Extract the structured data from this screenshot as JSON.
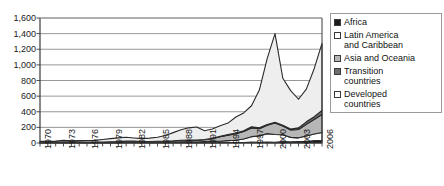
{
  "chart_data": {
    "type": "area",
    "stacked": true,
    "title": "",
    "xlabel": "",
    "ylabel": "",
    "ylim": [
      0,
      1600
    ],
    "ytick_step": 200,
    "grid": true,
    "legend_position": "right",
    "ytick_labels": [
      "1,600",
      "1,400",
      "1,200",
      "1,000",
      "800",
      "600",
      "400",
      "200",
      "0"
    ],
    "ytick_values": [
      1600,
      1400,
      1200,
      1000,
      800,
      600,
      400,
      200,
      0
    ],
    "xtick_labels": [
      "1970",
      "1973",
      "1976",
      "1979",
      "1982",
      "1985",
      "1988",
      "1991",
      "1994",
      "1997",
      "2000",
      "2003",
      "2006"
    ],
    "xtick_values": [
      1970,
      1973,
      1976,
      1979,
      1982,
      1985,
      1988,
      1991,
      1994,
      1997,
      2000,
      2003,
      2006
    ],
    "x": [
      1970,
      1971,
      1972,
      1973,
      1974,
      1975,
      1976,
      1977,
      1978,
      1979,
      1980,
      1981,
      1982,
      1983,
      1984,
      1985,
      1986,
      1987,
      1988,
      1989,
      1990,
      1991,
      1992,
      1993,
      1994,
      1995,
      1996,
      1997,
      1998,
      1999,
      2000,
      2001,
      2002,
      2003,
      2004,
      2005,
      2006
    ],
    "series": [
      {
        "name": "Africa",
        "color": "#1c1c1c",
        "values": [
          1,
          1,
          1,
          2,
          2,
          2,
          2,
          2,
          2,
          2,
          2,
          3,
          3,
          3,
          2,
          3,
          3,
          4,
          5,
          6,
          3,
          4,
          4,
          5,
          6,
          6,
          7,
          11,
          9,
          12,
          10,
          20,
          14,
          18,
          18,
          30,
          36
        ]
      },
      {
        "name": "Latin America\nand Caribbean",
        "color": "#ffffff",
        "values": [
          5,
          5,
          5,
          6,
          5,
          6,
          6,
          6,
          6,
          7,
          8,
          9,
          9,
          7,
          7,
          8,
          7,
          8,
          9,
          9,
          9,
          13,
          17,
          18,
          25,
          30,
          45,
          70,
          82,
          108,
          98,
          85,
          58,
          48,
          72,
          86,
          99
        ]
      },
      {
        "name": "Asia and Oceania",
        "color": "#b6b6b6",
        "values": [
          3,
          3,
          3,
          4,
          4,
          4,
          4,
          4,
          5,
          6,
          8,
          12,
          12,
          10,
          10,
          12,
          13,
          16,
          22,
          23,
          24,
          24,
          33,
          56,
          70,
          84,
          95,
          112,
          92,
          107,
          148,
          112,
          95,
          107,
          148,
          186,
          230
        ]
      },
      {
        "name": "Transition\ncountries",
        "color": "#6e6e6e",
        "values": [
          0,
          0,
          0,
          0,
          0,
          0,
          0,
          0,
          0,
          0,
          0,
          0,
          0,
          0,
          0,
          0,
          0,
          0,
          0,
          1,
          2,
          3,
          5,
          7,
          7,
          8,
          10,
          14,
          11,
          11,
          9,
          11,
          13,
          21,
          33,
          35,
          53
        ]
      },
      {
        "name": "Developed\ncountries",
        "color": "#eeeeee",
        "values": [
          13,
          14,
          15,
          22,
          16,
          18,
          20,
          22,
          32,
          41,
          48,
          49,
          40,
          36,
          43,
          50,
          73,
          105,
          134,
          155,
          167,
          113,
          121,
          135,
          147,
          205,
          228,
          270,
          484,
          843,
          1135,
          601,
          490,
          366,
          419,
          614,
          857
        ]
      }
    ],
    "legend": [
      {
        "label": "Africa",
        "swatch_color": "#1c1c1c"
      },
      {
        "label": "Latin America\nand Caribbean",
        "swatch_color": "#ffffff"
      },
      {
        "label": "Asia and Oceania",
        "swatch_color": "#b6b6b6"
      },
      {
        "label": "Transition\ncountries",
        "swatch_color": "#6e6e6e"
      },
      {
        "label": "Developed\ncountries",
        "swatch_color": "#ffffff"
      }
    ],
    "colors": {
      "axis": "#3a3a3a",
      "grid": "#8c8c8c",
      "series_outline": "#2a2a2a",
      "legend_border": "#9a9a9a",
      "text": "#111111"
    }
  }
}
